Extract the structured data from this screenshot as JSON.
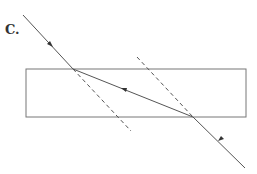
{
  "label": "C.",
  "colors": {
    "line": "#555555",
    "box": "#777777"
  },
  "diagram": {
    "type": "refraction through glass block",
    "elements": [
      "incident ray",
      "glass block",
      "refracted ray",
      "emergent ray",
      "normal lines (dashed)"
    ]
  }
}
